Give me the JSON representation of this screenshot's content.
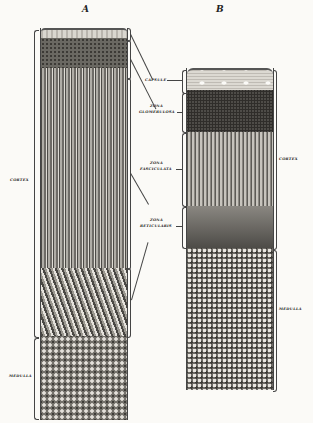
{
  "figure": {
    "panels": [
      {
        "id": "A",
        "label": "A"
      },
      {
        "id": "B",
        "label": "B"
      }
    ],
    "center_labels": [
      {
        "key": "capsule",
        "text": "CAPSULE"
      },
      {
        "key": "zona_glomerulosa_1",
        "text": "ZONA"
      },
      {
        "key": "zona_glomerulosa_2",
        "text": "GLOMERULOSA"
      },
      {
        "key": "zona_fasciculata_1",
        "text": "ZONA"
      },
      {
        "key": "zona_fasciculata_2",
        "text": "FASCICULATA"
      },
      {
        "key": "zona_reticularis_1",
        "text": "ZONA"
      },
      {
        "key": "zona_reticularis_2",
        "text": "RETICULARIS"
      }
    ],
    "panel_a_labels": {
      "cortex": "CORTEX",
      "medulla": "MEDULLA"
    },
    "panel_b_labels": {
      "cortex": "CORTEX",
      "medulla": "MEDULLA"
    },
    "colors": {
      "background": "#fbfaf7",
      "ink": "#222222",
      "capsule": "#d9d6cf",
      "glomerulosa": "#5a5853",
      "fasciculata": "#8f8c86",
      "reticularis": "#6e6b66",
      "medulla": "#75726c"
    }
  }
}
